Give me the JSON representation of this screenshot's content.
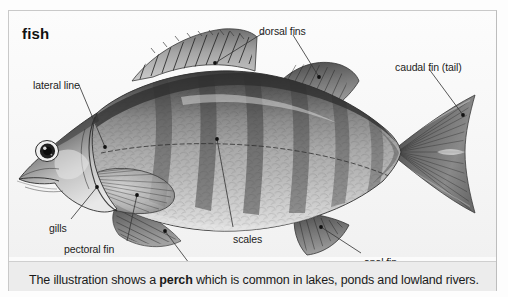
{
  "title": "fish",
  "caption": {
    "before": "The illustration shows a ",
    "bold": "perch",
    "after": " which is common in lakes, ponds and lowland rivers."
  },
  "labels": {
    "lateral_line": "lateral line",
    "dorsal_fins": "dorsal fins",
    "caudal_fin": "caudal fin (tail)",
    "gills": "gills",
    "pectoral_fin": "pectoral fin",
    "ventral_fins": "ventral fins",
    "scales": "scales",
    "anal_fin": "anal fin"
  },
  "colors": {
    "page_background": "#fdfdfd",
    "card_background": "#fbfbfb",
    "card_border": "#c9c9c9",
    "caption_band": "#ececec",
    "text": "#1a1a1a",
    "leader_line": "#3a3a3a",
    "fish_dark": "#3b3b3b",
    "fish_mid": "#8d8d8d",
    "fish_light": "#d2d2d2"
  }
}
